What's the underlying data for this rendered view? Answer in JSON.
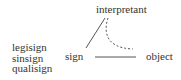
{
  "diagram": {
    "nodes": {
      "interpretant": "interpretant",
      "sign": "sign",
      "object": "object"
    },
    "sign_types": [
      "legisign",
      "sinsign",
      "qualisign"
    ],
    "edges": [
      {
        "from": "sign",
        "to": "interpretant",
        "style": "solid"
      },
      {
        "from": "sign",
        "to": "object",
        "style": "solid"
      },
      {
        "from": "interpretant",
        "to": "object",
        "style": "dashed-curve"
      }
    ],
    "colors": {
      "line": "#555555",
      "text": "#333333"
    }
  }
}
